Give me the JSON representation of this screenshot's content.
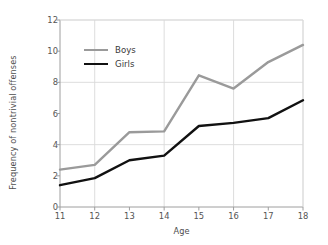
{
  "chart_data": {
    "type": "line",
    "title": "",
    "xlabel": "Age",
    "ylabel": "Frequency of nontrivial offenses",
    "x": [
      11,
      12,
      13,
      14,
      15,
      16,
      17,
      18
    ],
    "categories": [
      "11",
      "12",
      "13",
      "14",
      "15",
      "16",
      "17",
      "18"
    ],
    "xlim": [
      11,
      18
    ],
    "ylim": [
      0,
      12
    ],
    "ytick_values": [
      0,
      2,
      4,
      6,
      8,
      10,
      12
    ],
    "ytick_labels": [
      "0",
      "2",
      "4",
      "6",
      "8",
      "10",
      "12"
    ],
    "xtick_labels": [
      "11",
      "12",
      "13",
      "14",
      "15",
      "16",
      "17",
      "18"
    ],
    "grid": {
      "horizontal_at": [
        4,
        8,
        12
      ],
      "vertical_at": [
        12,
        14,
        16,
        18
      ],
      "color": "#d9d9d9"
    },
    "legend": {
      "position": "upper-left-inside",
      "entries": [
        "Boys",
        "Girls"
      ]
    },
    "series": [
      {
        "name": "Boys",
        "color": "#9a9a9a",
        "width": 2.4,
        "values": [
          2.4,
          2.7,
          4.8,
          4.85,
          8.45,
          7.6,
          9.3,
          10.4
        ]
      },
      {
        "name": "Girls",
        "color": "#111111",
        "width": 2.4,
        "values": [
          1.4,
          1.85,
          3.0,
          3.3,
          5.2,
          5.4,
          5.7,
          6.85
        ]
      }
    ],
    "axis_color": "#9e9e9e",
    "tick_label_color": "#555555",
    "background": "#ffffff"
  }
}
